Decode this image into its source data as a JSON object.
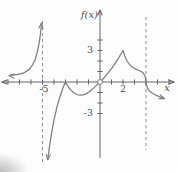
{
  "figure": {
    "background": "#fdfdfd"
  },
  "colors": {
    "axis": "#646464",
    "curve": "#7d7d7d",
    "dashed": "#8f8f8f",
    "text": "#4f4f4f"
  },
  "chart_data": {
    "type": "line",
    "xlabel": "x",
    "ylabel": "f(x)",
    "x_tick_values": [
      -8,
      -7,
      -6,
      -5,
      -4,
      -3,
      -2,
      -1,
      1,
      2,
      3,
      4,
      5,
      6
    ],
    "y_tick_values": [
      -3,
      -2,
      -1,
      1,
      2,
      3,
      4
    ],
    "x_tick_labels": [
      {
        "value": -5,
        "text": "-5",
        "dx": 1.5
      },
      {
        "value": 2,
        "text": "2",
        "dx": 0
      }
    ],
    "y_tick_labels": [
      {
        "value": 3,
        "text": "3"
      },
      {
        "value": -3,
        "text": "-3"
      }
    ],
    "asymptotes": [
      {
        "x": -5
      },
      {
        "x": 4
      }
    ],
    "open_point": {
      "x": 0,
      "y": 0
    },
    "features": [
      {
        "type": "vertical-asymptote",
        "x": -5
      },
      {
        "type": "corner",
        "x": -3,
        "y": 0
      },
      {
        "type": "removable-discontinuity",
        "x": 0,
        "y": 0
      },
      {
        "type": "cusp",
        "x": 2,
        "y": 3
      },
      {
        "type": "vertical-tangent",
        "x": 4,
        "y": 0
      }
    ],
    "series": [
      {
        "name": "branch-left-of-asymptote",
        "points": [
          [
            -7.9,
            0.62
          ],
          [
            -7.2,
            0.7
          ],
          [
            -6.6,
            0.88
          ],
          [
            -6.2,
            1.15
          ],
          [
            -5.9,
            1.55
          ],
          [
            -5.65,
            2.1
          ],
          [
            -5.45,
            2.85
          ],
          [
            -5.3,
            3.7
          ],
          [
            -5.2,
            4.4
          ],
          [
            -5.13,
            5.05
          ],
          [
            -5.1,
            5.6
          ]
        ],
        "arrows": [
          {
            "at": "start",
            "angle": 187
          },
          {
            "at": "end",
            "angle": -85
          }
        ]
      },
      {
        "name": "branch-main",
        "points": [
          [
            -4.55,
            -7.4
          ],
          [
            -4.4,
            -6.2
          ],
          [
            -4.2,
            -4.8
          ],
          [
            -4.0,
            -3.6
          ],
          [
            -3.75,
            -2.4
          ],
          [
            -3.5,
            -1.45
          ],
          [
            -3.25,
            -0.65
          ],
          [
            -3.1,
            -0.25
          ],
          [
            -3.0,
            0.0
          ],
          [
            -2.8,
            -0.4
          ],
          [
            -2.55,
            -0.75
          ],
          [
            -2.25,
            -1.05
          ],
          [
            -1.95,
            -1.22
          ],
          [
            -1.6,
            -1.26
          ],
          [
            -1.25,
            -1.15
          ],
          [
            -0.95,
            -0.95
          ],
          [
            -0.65,
            -0.68
          ],
          [
            -0.35,
            -0.37
          ],
          [
            0.0,
            0.0
          ],
          [
            0.3,
            0.33
          ],
          [
            0.6,
            0.72
          ],
          [
            0.95,
            1.2
          ],
          [
            1.3,
            1.75
          ],
          [
            1.65,
            2.35
          ],
          [
            2.0,
            3.0
          ],
          [
            2.15,
            2.5
          ],
          [
            2.35,
            2.0
          ],
          [
            2.6,
            1.62
          ],
          [
            2.9,
            1.35
          ],
          [
            3.2,
            1.18
          ],
          [
            3.5,
            1.05
          ],
          [
            3.75,
            0.88
          ],
          [
            3.92,
            0.55
          ],
          [
            4.0,
            0.0
          ],
          [
            4.1,
            -0.5
          ],
          [
            4.3,
            -0.85
          ],
          [
            4.6,
            -1.1
          ],
          [
            4.95,
            -1.3
          ],
          [
            5.3,
            -1.45
          ],
          [
            5.6,
            -1.58
          ]
        ],
        "arrows": [
          {
            "at": "start",
            "angle": 97
          },
          {
            "at": "end",
            "angle": 22
          }
        ]
      }
    ],
    "layout": {
      "origin_px": [
        100,
        82
      ],
      "unit_px": [
        11.5,
        10.5
      ],
      "x_axis_px": {
        "from": 2,
        "to": 174
      },
      "y_axis_px": {
        "from": 10,
        "to": 158
      },
      "asymptote_extents_px": [
        {
          "top": 21,
          "bottom": 163
        },
        {
          "top": 17,
          "bottom": 150
        }
      ],
      "tick_half": 2.6,
      "fx_label_pos": [
        98,
        18
      ],
      "x_label_pos": [
        167,
        91
      ],
      "x_tick_label_y_offset": 10,
      "y_tick_label_x_offset": -7
    }
  }
}
